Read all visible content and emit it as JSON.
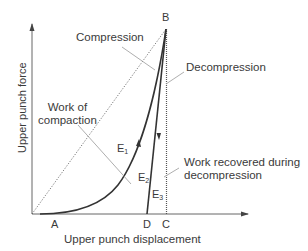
{
  "diagram": {
    "type": "force-displacement compaction cycle",
    "axes": {
      "x_label": "Upper punch displacement",
      "y_label": "Upper punch force"
    },
    "points": {
      "A": "A",
      "B": "B",
      "C": "C",
      "D": "D"
    },
    "energies": {
      "E1": "E",
      "E1_sub": "1",
      "E2": "E",
      "E2_sub": "2",
      "E3": "E",
      "E3_sub": "3"
    },
    "annotations": {
      "compression": "Compression",
      "decompression": "Decompression",
      "work_of_compaction_line1": "Work of",
      "work_of_compaction_line2": "compaction",
      "work_recovered_line1": "Work recovered during",
      "work_recovered_line2": "decompression"
    },
    "colors": {
      "curve": "#333333",
      "axis": "#666666",
      "leader": "#9a9a9a",
      "text": "#3a3a3a"
    }
  }
}
